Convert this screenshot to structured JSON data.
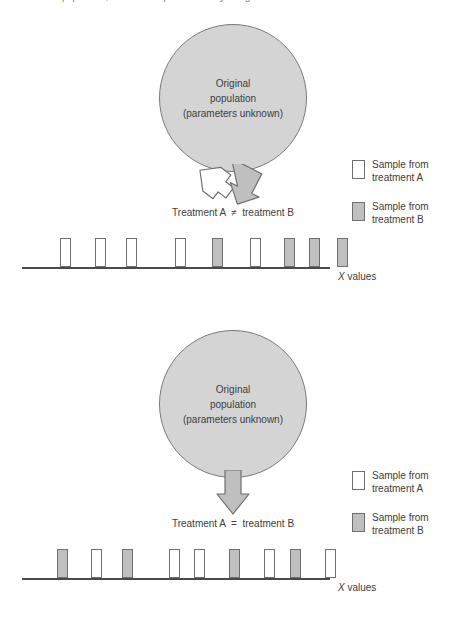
{
  "top_caption": "population, and the samples differ only along the scale.",
  "circle": {
    "line1": "Original",
    "line2": "population",
    "line3": "(parameters unknown)"
  },
  "legend": {
    "sample_a_line1": "Sample from",
    "sample_a_line2": "treatment A",
    "sample_b_line1": "Sample from",
    "sample_b_line2": "treatment B",
    "sample_a_color": "#ffffff",
    "sample_b_color": "#bfbfbf"
  },
  "axis_label": {
    "symbol": "X",
    "text": " values"
  },
  "colors": {
    "circle_fill": "#d4d4d4",
    "circle_stroke": "#7a7a7a",
    "arrow_gray_fill": "#bfbfbf",
    "arrow_white_fill": "#ffffff",
    "arrow_stroke": "#6f6f6f",
    "axis": "#4a4a4a",
    "text": "#3d3d3d"
  },
  "panels": [
    {
      "id": "unequal",
      "relation": "Treatment A  ≠  treatment B",
      "arrow_type": "diverging",
      "arrows": [
        {
          "direction": "down-left",
          "fill": "#ffffff"
        },
        {
          "direction": "down-right",
          "fill": "#bfbfbf"
        }
      ],
      "samples": [
        {
          "x": 38,
          "group": "A"
        },
        {
          "x": 73,
          "group": "A"
        },
        {
          "x": 104,
          "group": "A"
        },
        {
          "x": 153,
          "group": "A"
        },
        {
          "x": 190,
          "group": "B"
        },
        {
          "x": 228,
          "group": "A"
        },
        {
          "x": 262,
          "group": "B"
        },
        {
          "x": 287,
          "group": "B"
        },
        {
          "x": 315,
          "group": "B"
        }
      ]
    },
    {
      "id": "equal",
      "relation": "Treatment A  =  treatment B",
      "arrow_type": "single",
      "arrows": [
        {
          "direction": "down",
          "fill": "#bfbfbf"
        }
      ],
      "samples": [
        {
          "x": 35,
          "group": "B"
        },
        {
          "x": 69,
          "group": "A"
        },
        {
          "x": 100,
          "group": "B"
        },
        {
          "x": 147,
          "group": "A"
        },
        {
          "x": 172,
          "group": "A"
        },
        {
          "x": 207,
          "group": "B"
        },
        {
          "x": 242,
          "group": "A"
        },
        {
          "x": 268,
          "group": "B"
        },
        {
          "x": 303,
          "group": "A"
        }
      ]
    }
  ]
}
